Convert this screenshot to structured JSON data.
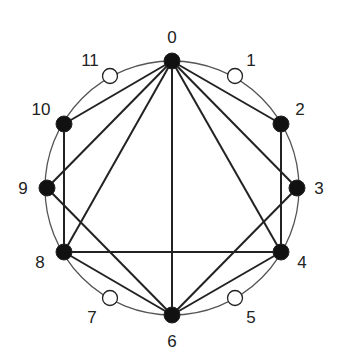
{
  "diagram": {
    "type": "circular-graph",
    "circle": {
      "cx": 172,
      "cy": 188,
      "r": 127,
      "stroke": "#555555"
    },
    "node_fill_active": "#111111",
    "node_fill_inactive": "#ffffff",
    "edge_color": "#222222",
    "nodes": [
      {
        "id": 0,
        "label": "0",
        "x": 172,
        "y": 61,
        "filled": true,
        "lx": 172,
        "ly": 37
      },
      {
        "id": 1,
        "label": "1",
        "x": 235,
        "y": 76,
        "filled": false,
        "lx": 251,
        "ly": 60
      },
      {
        "id": 2,
        "label": "2",
        "x": 281,
        "y": 124,
        "filled": true,
        "lx": 300,
        "ly": 109
      },
      {
        "id": 3,
        "label": "3",
        "x": 297,
        "y": 188,
        "filled": true,
        "lx": 319,
        "ly": 188
      },
      {
        "id": 4,
        "label": "4",
        "x": 281,
        "y": 252,
        "filled": true,
        "lx": 302,
        "ly": 262
      },
      {
        "id": 5,
        "label": "5",
        "x": 235,
        "y": 298,
        "filled": false,
        "lx": 251,
        "ly": 317
      },
      {
        "id": 6,
        "label": "6",
        "x": 172,
        "y": 315,
        "filled": true,
        "lx": 172,
        "ly": 341
      },
      {
        "id": 7,
        "label": "7",
        "x": 110,
        "y": 298,
        "filled": false,
        "lx": 92,
        "ly": 317
      },
      {
        "id": 8,
        "label": "8",
        "x": 64,
        "y": 252,
        "filled": true,
        "lx": 40,
        "ly": 262
      },
      {
        "id": 9,
        "label": "9",
        "x": 47,
        "y": 188,
        "filled": true,
        "lx": 23,
        "ly": 188
      },
      {
        "id": 10,
        "label": "10",
        "x": 64,
        "y": 124,
        "filled": true,
        "lx": 41,
        "ly": 109
      },
      {
        "id": 11,
        "label": "11",
        "x": 110,
        "y": 76,
        "filled": false,
        "lx": 90,
        "ly": 60
      }
    ],
    "edges": [
      [
        0,
        10
      ],
      [
        0,
        9
      ],
      [
        0,
        8
      ],
      [
        0,
        6
      ],
      [
        0,
        4
      ],
      [
        0,
        3
      ],
      [
        0,
        2
      ],
      [
        10,
        8
      ],
      [
        2,
        4
      ],
      [
        8,
        4
      ],
      [
        9,
        6
      ],
      [
        3,
        6
      ],
      [
        8,
        6
      ],
      [
        4,
        6
      ]
    ]
  }
}
